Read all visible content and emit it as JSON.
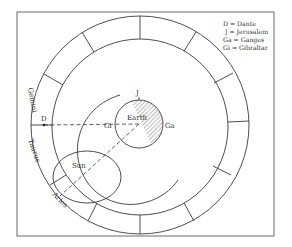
{
  "legend": [
    {
      "abbr": "D",
      "text": "D = Dante"
    },
    {
      "abbr": "J",
      "text": "J = Jerusalem"
    },
    {
      "abbr": "Ga",
      "text": "Ga = Ganges"
    },
    {
      "abbr": "Gi",
      "text": "Gi = Gibraltar"
    }
  ],
  "labels": {
    "earth": "Earth",
    "sun": "Sun",
    "dante": "D",
    "jerusalem": "J",
    "ganges": "Ga",
    "gibraltar": "Gi",
    "gemini": "Gemini",
    "taurus": "Taurus",
    "aries": "Aries"
  },
  "colors": {
    "line": "#3a3a3a",
    "hatch": "#555555",
    "background": "#ffffff"
  }
}
